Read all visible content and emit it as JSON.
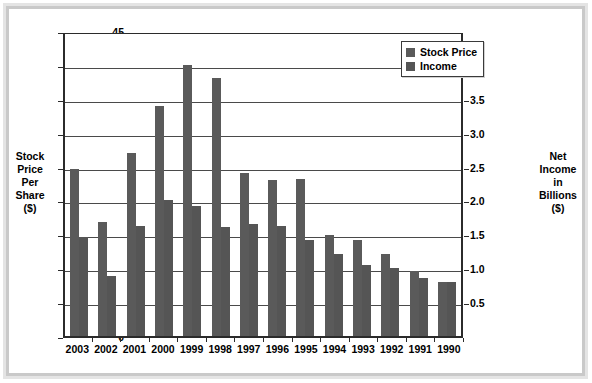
{
  "chart_data": {
    "type": "bar",
    "title": "",
    "xlabel": "",
    "ylabel": "Stock Price Per Share ($)",
    "y2label": "Net Income in Billions ($)",
    "categories": [
      "2003",
      "2002",
      "2001",
      "2000",
      "1999",
      "1998",
      "1997",
      "1996",
      "1995",
      "1994",
      "1993",
      "1992",
      "1991",
      "1990"
    ],
    "ylim": [
      0,
      45
    ],
    "y2lim": [
      0,
      4.5
    ],
    "yticks": [
      "0",
      "5",
      "10",
      "15",
      "20",
      "25",
      "30",
      "35",
      "40",
      "45"
    ],
    "y2ticks": [
      "0.5",
      "1.0",
      "1.5",
      "2.0",
      "2.5",
      "3.0",
      "3.5",
      "4.0"
    ],
    "grid": true,
    "legend_position": "top-right",
    "series": [
      {
        "name": "Stock Price",
        "axis": "left",
        "color": "#5a5a5a",
        "values": [
          24.7,
          16.8,
          27.0,
          34.0,
          40.0,
          38.0,
          24.1,
          23.0,
          23.1,
          14.9,
          14.2,
          12.1,
          9.6,
          8.0
        ]
      },
      {
        "name": "Income",
        "axis": "right",
        "color": "#555555",
        "values": [
          1.46,
          0.89,
          1.62,
          2.0,
          1.92,
          1.61,
          1.66,
          1.62,
          1.42,
          1.21,
          1.05,
          1.0,
          0.86,
          0.79
        ]
      }
    ]
  },
  "axes": {
    "left_title_lines": [
      "Stock",
      "Price",
      "Per",
      "Share",
      "($)"
    ],
    "right_title_lines": [
      "Net",
      "Income",
      "in",
      "Billions",
      "($)"
    ]
  },
  "legend": {
    "entries": [
      {
        "label": "Stock Price"
      },
      {
        "label": "Income"
      }
    ]
  },
  "colors": {
    "bar_stock": "#5a5a5a",
    "bar_income": "#555555",
    "axis": "#2b2b2b",
    "grid": "#4a4a4a",
    "frame_outer": "#e4e4e4",
    "frame_inner": "#c9c9c9",
    "background": "#ffffff"
  }
}
